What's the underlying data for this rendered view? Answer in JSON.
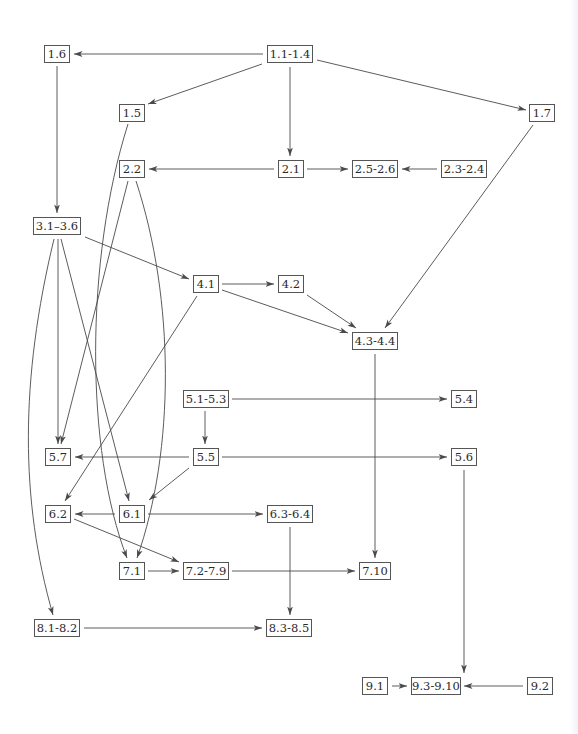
{
  "diagram": {
    "type": "dependency-graph",
    "colors": {
      "line": "#4a4a4a",
      "box_border": "#555555",
      "text": "#2a2a2a",
      "background": "#ffffff"
    },
    "nodes": [
      {
        "id": "n1_1",
        "label": "1.1-1.4",
        "x": 267,
        "y": 45,
        "w": 46
      },
      {
        "id": "n1_6",
        "label": "1.6",
        "x": 44,
        "y": 45,
        "w": 26
      },
      {
        "id": "n1_5",
        "label": "1.5",
        "x": 119,
        "y": 104,
        "w": 26
      },
      {
        "id": "n1_7",
        "label": "1.7",
        "x": 529,
        "y": 104,
        "w": 26
      },
      {
        "id": "n2_2",
        "label": "2.2",
        "x": 119,
        "y": 160,
        "w": 26
      },
      {
        "id": "n2_1",
        "label": "2.1",
        "x": 278,
        "y": 160,
        "w": 26
      },
      {
        "id": "n2_5",
        "label": "2.5-2.6",
        "x": 352,
        "y": 160,
        "w": 46
      },
      {
        "id": "n2_3",
        "label": "2.3-2.4",
        "x": 441,
        "y": 160,
        "w": 46
      },
      {
        "id": "n3_1",
        "label": "3.1–3.6",
        "x": 33,
        "y": 217,
        "w": 48
      },
      {
        "id": "n4_1",
        "label": "4.1",
        "x": 193,
        "y": 275,
        "w": 26
      },
      {
        "id": "n4_2",
        "label": "4.2",
        "x": 278,
        "y": 275,
        "w": 26
      },
      {
        "id": "n4_3",
        "label": "4.3-4.4",
        "x": 352,
        "y": 332,
        "w": 46
      },
      {
        "id": "n5_1",
        "label": "5.1-5.3",
        "x": 183,
        "y": 390,
        "w": 46
      },
      {
        "id": "n5_4",
        "label": "5.4",
        "x": 451,
        "y": 390,
        "w": 26
      },
      {
        "id": "n5_7",
        "label": "5.7",
        "x": 45,
        "y": 448,
        "w": 26
      },
      {
        "id": "n5_5",
        "label": "5.5",
        "x": 193,
        "y": 448,
        "w": 26
      },
      {
        "id": "n5_6",
        "label": "5.6",
        "x": 451,
        "y": 448,
        "w": 26
      },
      {
        "id": "n6_2",
        "label": "6.2",
        "x": 45,
        "y": 505,
        "w": 26
      },
      {
        "id": "n6_1",
        "label": "6.1",
        "x": 119,
        "y": 505,
        "w": 26
      },
      {
        "id": "n6_3",
        "label": "6.3-6.4",
        "x": 267,
        "y": 505,
        "w": 46
      },
      {
        "id": "n7_1",
        "label": "7.1",
        "x": 119,
        "y": 562,
        "w": 26
      },
      {
        "id": "n7_2",
        "label": "7.2-7.9",
        "x": 183,
        "y": 562,
        "w": 46
      },
      {
        "id": "n7_10",
        "label": "7.10",
        "x": 359,
        "y": 562,
        "w": 32
      },
      {
        "id": "n8_1",
        "label": "8.1-8.2",
        "x": 34,
        "y": 619,
        "w": 46
      },
      {
        "id": "n8_3",
        "label": "8.3-8.5",
        "x": 266,
        "y": 619,
        "w": 46
      },
      {
        "id": "n9_1",
        "label": "9.1",
        "x": 362,
        "y": 677,
        "w": 26
      },
      {
        "id": "n9_3",
        "label": "9.3-9.10",
        "x": 411,
        "y": 677,
        "w": 50
      },
      {
        "id": "n9_2",
        "label": "9.2",
        "x": 527,
        "y": 677,
        "w": 26
      }
    ],
    "edges": [
      {
        "from": "1.1-1.4",
        "to": "1.6"
      },
      {
        "from": "1.1-1.4",
        "to": "1.5"
      },
      {
        "from": "1.1-1.4",
        "to": "2.1"
      },
      {
        "from": "1.1-1.4",
        "to": "1.7"
      },
      {
        "from": "1.6",
        "to": "3.1–3.6"
      },
      {
        "from": "1.5",
        "to": "7.1"
      },
      {
        "from": "1.7",
        "to": "4.3-4.4"
      },
      {
        "from": "2.1",
        "to": "2.2"
      },
      {
        "from": "2.1",
        "to": "2.5-2.6"
      },
      {
        "from": "2.3-2.4",
        "to": "2.5-2.6"
      },
      {
        "from": "2.2",
        "to": "5.7"
      },
      {
        "from": "2.2",
        "to": "7.1"
      },
      {
        "from": "3.1–3.6",
        "to": "4.1"
      },
      {
        "from": "3.1–3.6",
        "to": "5.7"
      },
      {
        "from": "3.1–3.6",
        "to": "6.1"
      },
      {
        "from": "3.1–3.6",
        "to": "8.1-8.2"
      },
      {
        "from": "4.1",
        "to": "4.2"
      },
      {
        "from": "4.1",
        "to": "4.3-4.4"
      },
      {
        "from": "4.1",
        "to": "6.2"
      },
      {
        "from": "4.2",
        "to": "4.3-4.4"
      },
      {
        "from": "4.3-4.4",
        "to": "7.10"
      },
      {
        "from": "5.1-5.3",
        "to": "5.4"
      },
      {
        "from": "5.1-5.3",
        "to": "5.5"
      },
      {
        "from": "5.5",
        "to": "5.7"
      },
      {
        "from": "5.5",
        "to": "5.6"
      },
      {
        "from": "5.5",
        "to": "6.1"
      },
      {
        "from": "5.6",
        "to": "9.3-9.10"
      },
      {
        "from": "6.1",
        "to": "6.2"
      },
      {
        "from": "6.1",
        "to": "6.3-6.4"
      },
      {
        "from": "6.2",
        "to": "7.2-7.9"
      },
      {
        "from": "6.3-6.4",
        "to": "8.3-8.5"
      },
      {
        "from": "7.1",
        "to": "7.2-7.9"
      },
      {
        "from": "7.2-7.9",
        "to": "7.10"
      },
      {
        "from": "8.1-8.2",
        "to": "8.3-8.5"
      },
      {
        "from": "9.1",
        "to": "9.3-9.10"
      },
      {
        "from": "9.2",
        "to": "9.3-9.10"
      }
    ]
  }
}
